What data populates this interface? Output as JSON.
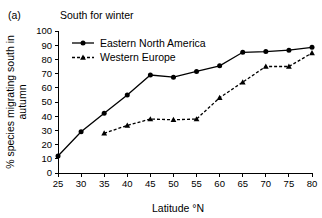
{
  "figure": {
    "panel_label": "(a)",
    "title": "South for winter"
  },
  "chart_data": {
    "type": "line",
    "title": "South for winter",
    "panel_label": "(a)",
    "xlabel": "Latitude °N",
    "ylabel": "% species migrating south in autumn",
    "ylabel_lines": [
      "% species migrating south in",
      "autumn"
    ],
    "x": [
      25,
      30,
      35,
      40,
      45,
      50,
      55,
      60,
      65,
      70,
      75,
      80
    ],
    "xlim": [
      25,
      80
    ],
    "ylim": [
      0,
      100
    ],
    "xticks": [
      25,
      30,
      35,
      40,
      45,
      50,
      55,
      60,
      65,
      70,
      75,
      80
    ],
    "yticks": [
      0,
      10,
      20,
      30,
      40,
      50,
      60,
      70,
      80,
      90,
      100
    ],
    "grid": false,
    "legend_position": "upper-left-inside",
    "series": [
      {
        "name": "Eastern North America",
        "marker": "circle",
        "linestyle": "solid",
        "color": "#000000",
        "x": [
          25,
          30,
          35,
          40,
          45,
          50,
          55,
          60,
          65,
          70,
          75,
          80
        ],
        "values": [
          12,
          29,
          42,
          55,
          69,
          67.5,
          71.5,
          75.5,
          85,
          85.5,
          86.5,
          88.5
        ]
      },
      {
        "name": "Western Europe",
        "marker": "triangle",
        "linestyle": "dashed",
        "color": "#000000",
        "x": [
          35,
          40,
          45,
          50,
          55,
          60,
          65,
          70,
          75,
          80
        ],
        "values": [
          28,
          33.5,
          38,
          37.5,
          38,
          53,
          64,
          75,
          75,
          84.5
        ]
      }
    ]
  }
}
